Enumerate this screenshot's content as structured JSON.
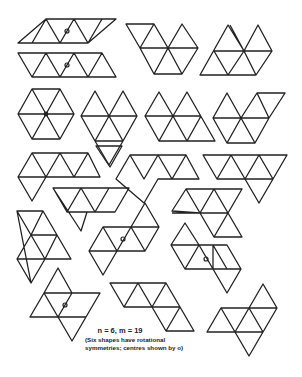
{
  "caption": {
    "title": "n = 6, m = 19",
    "note_line1": "(Six shapes have rotational",
    "note_line2": "symmetries; centres shown by o)"
  },
  "figure": {
    "n": 6,
    "m": 19,
    "shapes_with_rotational_symmetry": 6,
    "stroke_color": "#222222",
    "background_color": "#ffffff"
  }
}
